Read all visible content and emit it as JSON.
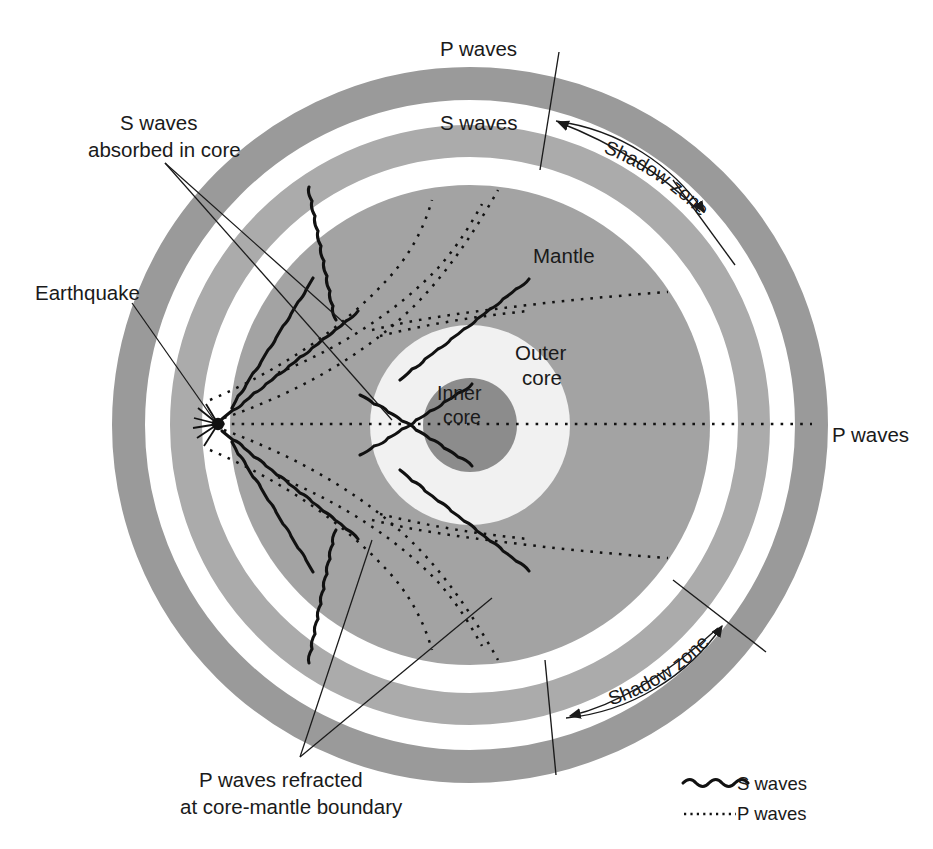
{
  "figure": {
    "background": "#ffffff"
  },
  "colors": {
    "outer_band_dark": "#9a9a9a",
    "mid_band_gray": "#ababab",
    "mantle_gray": "#a3a3a3",
    "outer_core": "#f1f1f1",
    "inner_core": "#8c8c8c",
    "white_gap": "#ffffff",
    "ink": "#1a1a1a"
  },
  "layers": {
    "mantle_label": "Mantle",
    "outer_core_label_line1": "Outer",
    "outer_core_label_line2": "core",
    "inner_core_label_line1": "Inner",
    "inner_core_label_line2": "core"
  },
  "labels": {
    "p_waves_top": "P waves",
    "s_waves_top": "S waves",
    "p_waves_right": "P waves",
    "shadow_zone_top": "Shadow zone",
    "shadow_zone_bottom": "Shadow zone",
    "earthquake": "Earthquake",
    "s_absorbed_line1": "S waves",
    "s_absorbed_line2": "absorbed in core",
    "p_refracted_line1": "P waves refracted",
    "p_refracted_line2": "at core-mantle boundary"
  },
  "legend": {
    "items": [
      {
        "label": "S waves",
        "symbol": "wavy-line"
      },
      {
        "label": "P waves",
        "symbol": "hatched-line"
      }
    ]
  },
  "geometry": {
    "center_x": 470,
    "center_y": 425,
    "inner_core_radius": 47,
    "outer_core_radius": 100,
    "mantle_radius": 240,
    "band_mid_inner_radius": 268,
    "band_mid_outer_radius": 300,
    "band_outer_inner_radius": 325,
    "band_outer_outer_radius": 358,
    "focus_x": 218,
    "focus_y": 424
  }
}
